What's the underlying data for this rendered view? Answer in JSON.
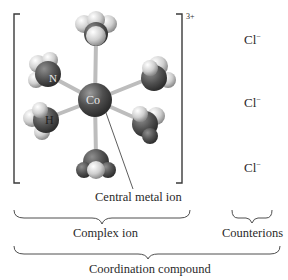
{
  "diagram": {
    "complex": {
      "charge": "3+",
      "central_atom_label": "Co",
      "ligand_atom_labels": {
        "nitrogen": "N",
        "hydrogen": "H"
      },
      "ligand_count": 6
    },
    "counterions": [
      {
        "symbol": "Cl",
        "charge": "−"
      },
      {
        "symbol": "Cl",
        "charge": "−"
      },
      {
        "symbol": "Cl",
        "charge": "−"
      }
    ],
    "labels": {
      "central_metal_ion": "Central metal ion",
      "complex_ion": "Complex ion",
      "counterions": "Counterions",
      "coordination_compound": "Coordination compound"
    },
    "colors": {
      "bracket": "#3a3a3a",
      "bond": "#b8b8b8",
      "atom_dark": "#4a4a4a",
      "atom_light": "#d9d9d9",
      "text": "#2a2a2a"
    }
  }
}
